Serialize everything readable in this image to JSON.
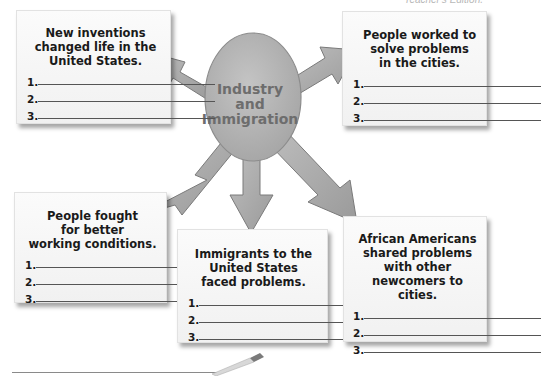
{
  "header": {
    "note": "Teacher's Edition."
  },
  "center": {
    "label": "Industry\nand\nImmigration"
  },
  "colors": {
    "arrow_fill": "#a9a9a9",
    "arrow_stroke": "#7a7a7a",
    "oval_fill": "#b3b3b3",
    "center_text": "#6d6d6d",
    "box_bg": "#f5f5f5",
    "text": "#1a1a1a"
  },
  "boxes": [
    {
      "id": "inventions",
      "title": "New inventions\nchanged life in the\nUnited States.",
      "lines": [
        {
          "number": "1.",
          "value": ""
        },
        {
          "number": "2.",
          "value": ""
        },
        {
          "number": "3.",
          "value": ""
        }
      ]
    },
    {
      "id": "cities",
      "title": "People worked to\nsolve problems\nin the cities.",
      "lines": [
        {
          "number": "1.",
          "value": ""
        },
        {
          "number": "2.",
          "value": ""
        },
        {
          "number": "3.",
          "value": ""
        }
      ]
    },
    {
      "id": "working-conditions",
      "title": "People fought\nfor better\nworking conditions.",
      "lines": [
        {
          "number": "1.",
          "value": ""
        },
        {
          "number": "2.",
          "value": ""
        },
        {
          "number": "3.",
          "value": ""
        }
      ]
    },
    {
      "id": "immigrants",
      "title": "Immigrants to the\nUnited States\nfaced problems.",
      "lines": [
        {
          "number": "1.",
          "value": ""
        },
        {
          "number": "2.",
          "value": ""
        },
        {
          "number": "3.",
          "value": ""
        }
      ]
    },
    {
      "id": "african-americans",
      "title": "African Americans\nshared problems\nwith other\nnewcomers to cities.",
      "lines": [
        {
          "number": "1.",
          "value": ""
        },
        {
          "number": "2.",
          "value": ""
        },
        {
          "number": "3.",
          "value": ""
        }
      ]
    }
  ]
}
